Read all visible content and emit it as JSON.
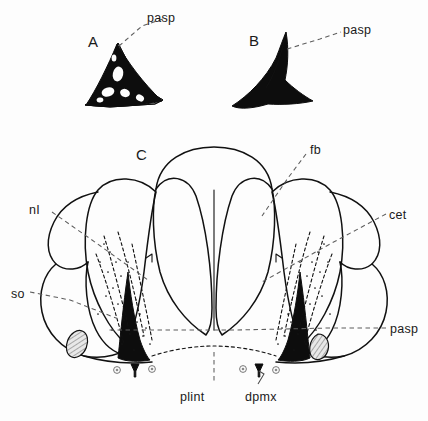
{
  "figure": {
    "background_color": "#fdfdfd",
    "ink_color": "#111111",
    "leader_color": "#5d5d5d",
    "panels": [
      {
        "id": "A",
        "letter": "A",
        "caption": "spiky triangular process, latticed",
        "x": 88,
        "y": 33
      },
      {
        "id": "B",
        "letter": "B",
        "caption": "solid triangular process",
        "x": 249,
        "y": 32
      },
      {
        "id": "C",
        "letter": "C",
        "caption": "dorsal view of cranium",
        "x": 136,
        "y": 146
      }
    ],
    "labels": [
      {
        "id": "pasp-a",
        "text": "pasp",
        "x": 147,
        "y": 11,
        "panel": "A",
        "leader": true
      },
      {
        "id": "pasp-b",
        "text": "pasp",
        "x": 343,
        "y": 23,
        "panel": "B",
        "leader": true
      },
      {
        "id": "fb",
        "text": "fb",
        "x": 310,
        "y": 143,
        "panel": "C",
        "leader": true
      },
      {
        "id": "cet",
        "text": "cet",
        "x": 389,
        "y": 208,
        "panel": "C",
        "leader": true
      },
      {
        "id": "nI",
        "text": "nI",
        "x": 29,
        "y": 203,
        "panel": "C",
        "leader": true
      },
      {
        "id": "so",
        "text": "so",
        "x": 11,
        "y": 287,
        "panel": "C",
        "leader": true
      },
      {
        "id": "pasp-c",
        "text": "pasp",
        "x": 390,
        "y": 322,
        "panel": "C",
        "leader": true
      },
      {
        "id": "plint",
        "text": "plint",
        "x": 180,
        "y": 390,
        "panel": "C",
        "leader": true
      },
      {
        "id": "dpmx",
        "text": "dpmx",
        "x": 245,
        "y": 390,
        "panel": "C",
        "leader": true
      }
    ],
    "abbreviations": {
      "pasp": "parasphenoid",
      "fb": "frontal bone",
      "cet": "cetacean element",
      "nI": "nasal I",
      "so": "supraoccipital",
      "plint": "palatine internal",
      "dpmx": "dorsal premaxilla"
    }
  }
}
